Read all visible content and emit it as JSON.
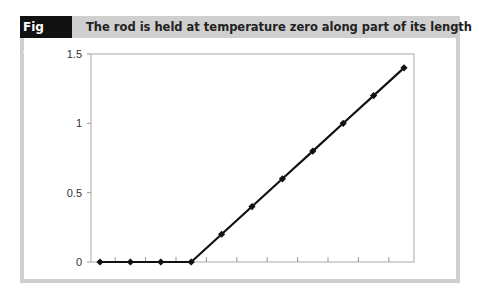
{
  "figure": {
    "label": "Fig A4.9",
    "title": "The rod is held at temperature zero along part of its length"
  },
  "chart_data": {
    "type": "line",
    "title": "The rod is held at temperature zero along part of its length",
    "xlabel": "",
    "ylabel": "",
    "x": [
      0,
      1,
      2,
      3,
      4,
      5,
      6,
      7,
      8,
      9,
      10
    ],
    "series": [
      {
        "name": "temperature",
        "values": [
          0,
          0,
          0,
          0,
          0.2,
          0.4,
          0.6,
          0.8,
          1.0,
          1.2,
          1.4
        ]
      }
    ],
    "ylim": [
      0,
      1.5
    ],
    "yticks": [
      "0",
      "0.5",
      "1",
      "1.5"
    ],
    "xtick_labels": [],
    "grid": false,
    "legend": "none",
    "line_color": "#111111",
    "marker": "diamond"
  }
}
